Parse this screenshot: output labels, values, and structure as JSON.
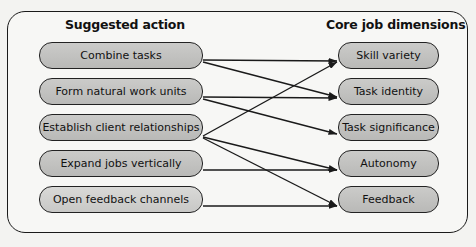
{
  "headings": {
    "left": "Suggested action",
    "right": "Core job dimensions"
  },
  "actions": [
    {
      "label": "Combine tasks"
    },
    {
      "label": "Form natural work units"
    },
    {
      "label": "Establish client relationships"
    },
    {
      "label": "Expand jobs vertically"
    },
    {
      "label": "Open feedback channels"
    }
  ],
  "dimensions": [
    {
      "label": "Skill variety"
    },
    {
      "label": "Task identity"
    },
    {
      "label": "Task significance"
    },
    {
      "label": "Autonomy"
    },
    {
      "label": "Feedback"
    }
  ],
  "connections": [
    {
      "from": "Combine tasks",
      "to": "Skill variety"
    },
    {
      "from": "Combine tasks",
      "to": "Task identity"
    },
    {
      "from": "Form natural work units",
      "to": "Task identity"
    },
    {
      "from": "Form natural work units",
      "to": "Task significance"
    },
    {
      "from": "Establish client relationships",
      "to": "Skill variety"
    },
    {
      "from": "Establish client relationships",
      "to": "Autonomy"
    },
    {
      "from": "Establish client relationships",
      "to": "Feedback"
    },
    {
      "from": "Expand jobs vertically",
      "to": "Autonomy"
    },
    {
      "from": "Open feedback channels",
      "to": "Feedback"
    }
  ],
  "colors": {
    "box_fill": "#c2c2c0",
    "stroke": "#1a1a1a",
    "background": "#f7f7f5"
  }
}
